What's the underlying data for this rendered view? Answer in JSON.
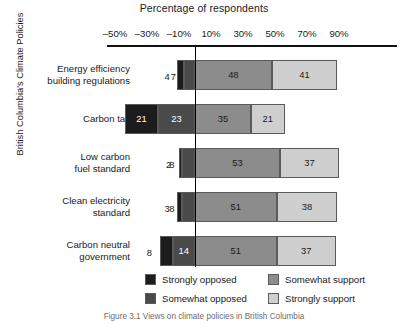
{
  "chart_data": {
    "type": "bar",
    "subtype": "diverging-stacked-bar",
    "title": "",
    "xlabel": "Percentage of respondents",
    "ylabel": "British Columbia's Climate Policies",
    "xlim": [
      -60,
      100
    ],
    "xticks": [
      -50,
      -30,
      -10,
      10,
      30,
      50,
      70,
      90
    ],
    "xtick_labels": [
      "–50%",
      "–30%",
      "–10%",
      "10%",
      "30%",
      "50%",
      "70%",
      "90%"
    ],
    "grid": false,
    "zero_line": true,
    "legend_position": "bottom",
    "categories": [
      "Energy efficiency building regulations",
      "Carbon tax",
      "Low carbon fuel standard",
      "Clean electricity standard",
      "Carbon neutral government"
    ],
    "series": [
      {
        "name": "Strongly opposed",
        "color": "#1c1c1c",
        "values": [
          4,
          21,
          2,
          3,
          8
        ]
      },
      {
        "name": "Somewhat opposed",
        "color": "#4a4a4a",
        "values": [
          7,
          23,
          8,
          8,
          14
        ]
      },
      {
        "name": "Somewhat support",
        "color": "#8c8c8c",
        "values": [
          48,
          35,
          53,
          51,
          51
        ]
      },
      {
        "name": "Strongly support",
        "color": "#cfcfcf",
        "values": [
          41,
          21,
          37,
          38,
          37
        ]
      }
    ]
  },
  "axis": {
    "title": "Percentage of respondents",
    "ylabel": "British Columbia's Climate Policies",
    "ticks": [
      "–50%",
      "–30%",
      "–10%",
      "10%",
      "30%",
      "50%",
      "70%",
      "90%"
    ]
  },
  "rows": [
    {
      "label_line1": "Energy efficiency",
      "label_line2": "building regulations",
      "values": {
        "strongly_opposed": "4",
        "somewhat_opposed": "7",
        "somewhat_support": "48",
        "strongly_support": "41"
      }
    },
    {
      "label_line1": "Carbon tax",
      "label_line2": "",
      "values": {
        "strongly_opposed": "21",
        "somewhat_opposed": "23",
        "somewhat_support": "35",
        "strongly_support": "21"
      }
    },
    {
      "label_line1": "Low carbon",
      "label_line2": "fuel standard",
      "values": {
        "strongly_opposed": "2",
        "somewhat_opposed": "8",
        "somewhat_support": "53",
        "strongly_support": "37"
      }
    },
    {
      "label_line1": "Clean electricity",
      "label_line2": "standard",
      "values": {
        "strongly_opposed": "3",
        "somewhat_opposed": "8",
        "somewhat_support": "51",
        "strongly_support": "38"
      }
    },
    {
      "label_line1": "Carbon neutral",
      "label_line2": "government",
      "values": {
        "strongly_opposed": "8",
        "somewhat_opposed": "14",
        "somewhat_support": "51",
        "strongly_support": "37"
      }
    }
  ],
  "legend": {
    "items": [
      {
        "label": "Strongly opposed",
        "color": "#1c1c1c"
      },
      {
        "label": "Somewhat opposed",
        "color": "#4a4a4a"
      },
      {
        "label": "Somewhat support",
        "color": "#8c8c8c"
      },
      {
        "label": "Strongly support",
        "color": "#cfcfcf"
      }
    ]
  },
  "caption": "Figure 3.1  Views on climate policies in British Columbia"
}
